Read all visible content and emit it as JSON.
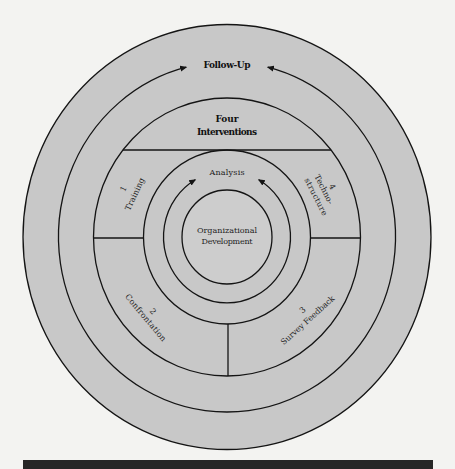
{
  "diagram": {
    "outer_ring": {
      "label": "Follow-Up"
    },
    "interventions_header": {
      "line1": "Four",
      "line2": "Interventions"
    },
    "interventions": [
      {
        "number": "1",
        "label": "Training"
      },
      {
        "number": "2",
        "label": "Confrontation"
      },
      {
        "number": "3",
        "label": "Survey Feedback"
      },
      {
        "number": "4",
        "label_line1": "Techno-",
        "label_line2": "structure"
      }
    ],
    "analysis_ring": {
      "label": "Analysis"
    },
    "center": {
      "line1": "Organizational",
      "line2": "Development"
    }
  },
  "colors": {
    "background": "#f3f3f1",
    "ring_fill": "#c8c8c8",
    "center_fill": "#cdcdcd",
    "stroke": "#141414",
    "caption_bar": "#262626"
  }
}
